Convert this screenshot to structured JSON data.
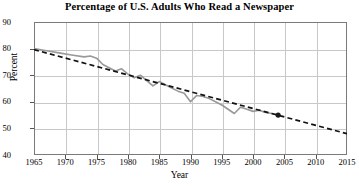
{
  "chart_data": {
    "type": "line",
    "title": "Percentage of U.S. Adults Who Read a Newspaper",
    "xlabel": "Year",
    "ylabel": "Percent",
    "xlim": [
      1965,
      2015
    ],
    "ylim": [
      40,
      90
    ],
    "xticks": [
      1965,
      1970,
      1975,
      1980,
      1985,
      1990,
      1995,
      2000,
      2005,
      2010,
      2015
    ],
    "yticks": [
      40,
      50,
      60,
      70,
      80,
      90
    ],
    "grid": true,
    "legend": "none",
    "series": [
      {
        "name": "Percentage of U.S. adults who read a newspaper",
        "style": "solid",
        "color": "#999999",
        "x": [
          1965,
          1967,
          1969,
          1971,
          1973,
          1974,
          1975,
          1976,
          1977,
          1978,
          1979,
          1980,
          1981,
          1982,
          1983,
          1984,
          1985,
          1986,
          1987,
          1988,
          1989,
          1990,
          1991,
          1992,
          1993,
          1994,
          1995,
          1996,
          1997,
          1998,
          1999,
          2000,
          2001,
          2002,
          2003,
          2004
        ],
        "values": [
          80.0,
          79.2,
          78.4,
          77.6,
          76.9,
          77.2,
          76.4,
          74.0,
          72.8,
          71.6,
          72.4,
          70.4,
          69.0,
          70.0,
          68.0,
          66.0,
          67.6,
          66.4,
          65.2,
          64.0,
          63.2,
          60.0,
          62.4,
          62.0,
          61.2,
          60.0,
          58.8,
          57.2,
          55.6,
          58.0,
          57.2,
          56.4,
          56.8,
          56.0,
          55.6,
          55.0
        ]
      },
      {
        "name": "Linear trend line",
        "style": "dashed",
        "color": "#111111",
        "x": [
          1965,
          2015
        ],
        "values": [
          79.6,
          48.0
        ]
      }
    ],
    "end_marker": {
      "x": 2004,
      "y": 55.0,
      "color": "#1a1a1a"
    }
  },
  "axes": {
    "y_tick_labels": [
      "90",
      "80",
      "70",
      "60",
      "50",
      "40"
    ],
    "x_tick_labels": [
      "1965",
      "1970",
      "1975",
      "1980",
      "1985",
      "1990",
      "1995",
      "2000",
      "2005",
      "2010",
      "2015"
    ]
  },
  "colors": {
    "data_line": "#999999",
    "trend_line": "#111111",
    "grid": "#c8c8c8",
    "frame": "#7a7a7a",
    "background": "#ffffff"
  }
}
